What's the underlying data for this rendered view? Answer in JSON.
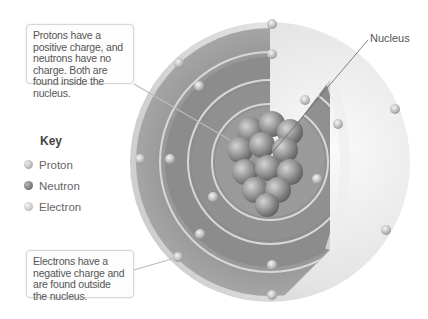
{
  "callouts": {
    "protons_neutrons": "Protons have a positive charge, and neutrons have no charge. Both are found inside the nucleus.",
    "electrons": "Electrons have a negative charge and are found outside the nucleus."
  },
  "labels": {
    "nucleus": "Nucleus"
  },
  "key": {
    "title": "Key",
    "items": [
      {
        "label": "Proton",
        "color": "#b8b8b8"
      },
      {
        "label": "Neutron",
        "color": "#7a7a7a"
      },
      {
        "label": "Electron",
        "color": "#c9c9c9"
      }
    ]
  },
  "colors": {
    "shell_dark": "#8f8f8f",
    "shell_light": "#e8e8e8",
    "nucleus": "#9a9a9a"
  }
}
